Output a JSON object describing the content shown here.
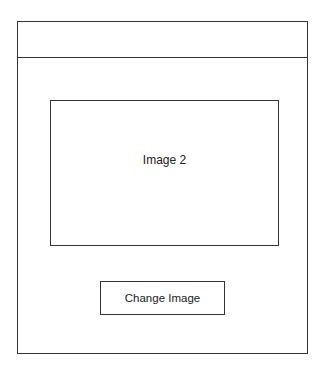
{
  "window": {
    "header_title": ""
  },
  "main": {
    "image_placeholder": {
      "label": "Image 2"
    },
    "change_image_button": {
      "label": "Change Image"
    }
  },
  "colors": {
    "line": "#333333",
    "background": "#ffffff",
    "text": "#222222"
  }
}
